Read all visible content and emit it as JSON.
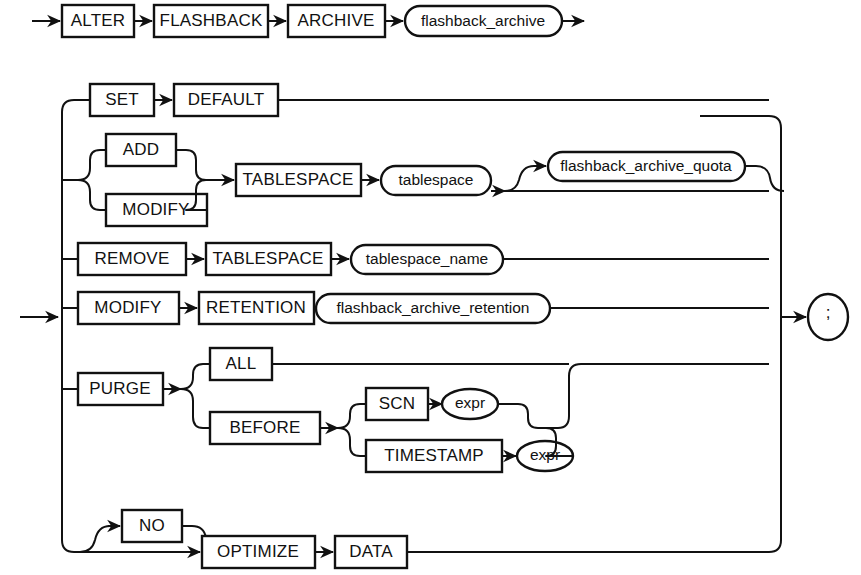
{
  "diagram": {
    "type": "railroad-syntax-diagram",
    "colors": {
      "ink": "#111111",
      "paper": "#ffffff"
    },
    "header": {
      "keywords": [
        {
          "id": "alter",
          "label": "ALTER"
        },
        {
          "id": "flashback",
          "label": "FLASHBACK"
        },
        {
          "id": "archive",
          "label": "ARCHIVE"
        }
      ],
      "variable": {
        "id": "flashback_archive",
        "label": "flashback_archive"
      }
    },
    "branches": [
      {
        "id": "set-default",
        "items": [
          {
            "kind": "keyword",
            "id": "set",
            "label": "SET"
          },
          {
            "kind": "keyword",
            "id": "default",
            "label": "DEFAULT"
          }
        ]
      },
      {
        "id": "add-modify-tablespace",
        "choice": [
          {
            "kind": "keyword",
            "id": "add",
            "label": "ADD"
          },
          {
            "kind": "keyword",
            "id": "modify-ts",
            "label": "MODIFY"
          }
        ],
        "items": [
          {
            "kind": "keyword",
            "id": "tablespace-kw",
            "label": "TABLESPACE"
          },
          {
            "kind": "variable",
            "id": "tablespace",
            "label": "tablespace"
          }
        ],
        "optional": {
          "kind": "variable",
          "id": "flashback_archive_quota",
          "label": "flashback_archive_quota"
        }
      },
      {
        "id": "remove-tablespace",
        "items": [
          {
            "kind": "keyword",
            "id": "remove",
            "label": "REMOVE"
          },
          {
            "kind": "keyword",
            "id": "tablespace-kw-2",
            "label": "TABLESPACE"
          },
          {
            "kind": "variable",
            "id": "tablespace_name",
            "label": "tablespace_name"
          }
        ]
      },
      {
        "id": "modify-retention",
        "items": [
          {
            "kind": "keyword",
            "id": "modify-ret",
            "label": "MODIFY"
          },
          {
            "kind": "keyword",
            "id": "retention",
            "label": "RETENTION"
          },
          {
            "kind": "variable",
            "id": "flashback_archive_retention",
            "label": "flashback_archive_retention"
          }
        ]
      },
      {
        "id": "purge",
        "items": [
          {
            "kind": "keyword",
            "id": "purge",
            "label": "PURGE"
          }
        ],
        "choice": [
          {
            "kind": "keyword",
            "id": "all",
            "label": "ALL"
          },
          {
            "kind": "keyword",
            "id": "before",
            "label": "BEFORE"
          }
        ],
        "before_choice": [
          {
            "kind": "keyword",
            "id": "scn",
            "label": "SCN"
          },
          {
            "kind": "variable",
            "id": "expr-scn",
            "label": "expr"
          },
          {
            "kind": "keyword",
            "id": "timestamp",
            "label": "TIMESTAMP"
          },
          {
            "kind": "variable",
            "id": "expr-ts",
            "label": "expr"
          }
        ]
      },
      {
        "id": "optimize-data",
        "optional": {
          "kind": "keyword",
          "id": "no",
          "label": "NO"
        },
        "items": [
          {
            "kind": "keyword",
            "id": "optimize",
            "label": "OPTIMIZE"
          },
          {
            "kind": "keyword",
            "id": "data",
            "label": "DATA"
          }
        ]
      }
    ],
    "terminator": {
      "id": "semicolon",
      "label": ";"
    }
  }
}
